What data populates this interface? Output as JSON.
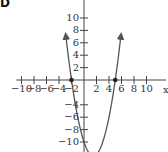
{
  "figure": {
    "corner_label": "D"
  },
  "chart_data": {
    "type": "line",
    "title": "",
    "xlabel": "x",
    "ylabel": "y",
    "xlim": [
      -10.5,
      13
    ],
    "ylim": [
      -11.5,
      12.5
    ],
    "x_ticks": [
      -10,
      -8,
      -6,
      -4,
      -2,
      2,
      4,
      6,
      8,
      10
    ],
    "x_tick_labels": [
      "−10",
      "−8",
      "−6",
      "−4",
      "−2",
      "2",
      "4",
      "6",
      "8",
      "10"
    ],
    "y_ticks": [
      10,
      8,
      6,
      4,
      2,
      -4,
      -6,
      -8,
      -10
    ],
    "y_tick_labels": [
      "10",
      "8",
      "6",
      "4",
      "2",
      "−4",
      "−6",
      "−8",
      "−10"
    ],
    "grid": false,
    "series": [
      {
        "name": "parabola",
        "equation": "y = x^2 - 3x - 10",
        "x": [
          -2.9,
          -2.5,
          -2,
          -1,
          0,
          1,
          1.5,
          2,
          3,
          4,
          5,
          5.5,
          5.9
        ],
        "values": [
          7.1,
          3.75,
          0,
          -6,
          -10,
          -12,
          -12.25,
          -12,
          -10,
          -6,
          0,
          3.75,
          7.1
        ],
        "arrows_at_ends": true,
        "color": "#555555"
      }
    ],
    "marked_points": [
      {
        "x": -2,
        "y": 0,
        "label": "x-intercept"
      },
      {
        "x": 5,
        "y": 0,
        "label": "x-intercept"
      }
    ]
  }
}
